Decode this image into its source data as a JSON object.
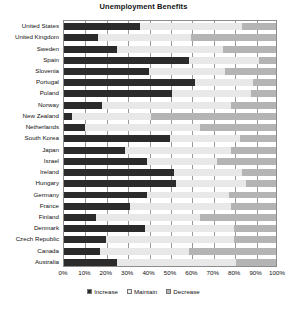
{
  "chart_data": {
    "type": "bar",
    "orientation": "horizontal",
    "stacked": true,
    "normalized_percent": true,
    "title": "Unemployment Benefits",
    "xlabel": "",
    "ylabel": "",
    "xlim": [
      0,
      100
    ],
    "xticks": [
      "0%",
      "10%",
      "20%",
      "30%",
      "40%",
      "50%",
      "60%",
      "70%",
      "80%",
      "90%",
      "100%"
    ],
    "xtick_values": [
      0,
      10,
      20,
      30,
      40,
      50,
      60,
      70,
      80,
      90,
      100
    ],
    "grid": true,
    "legend_position": "bottom",
    "legend": [
      "Increase",
      "Maintain",
      "Decrease"
    ],
    "categories": [
      "United States",
      "United Kingdom",
      "Sweden",
      "Spain",
      "Slovenia",
      "Portugal",
      "Poland",
      "Norway",
      "New Zealand",
      "Netherlands",
      "South Korea",
      "Japan",
      "Israel",
      "Ireland",
      "Hungary",
      "Germany",
      "France",
      "Finland",
      "Denmark",
      "Czech Republic",
      "Canada",
      "Australia"
    ],
    "series": [
      {
        "name": "Increase",
        "color": "#2b2b2b",
        "values": [
          36,
          16,
          25,
          59,
          40,
          62,
          51,
          18,
          4,
          10,
          50,
          29,
          39,
          52,
          53,
          39,
          31,
          15,
          38,
          20,
          17,
          25
        ]
      },
      {
        "name": "Maintain",
        "color": "#e8e8e8",
        "values": [
          48,
          44,
          50,
          33,
          36,
          27,
          37,
          61,
          37,
          54,
          33,
          50,
          33,
          32,
          33,
          39,
          48,
          49,
          42,
          60,
          42,
          56
        ]
      },
      {
        "name": "Decrease",
        "color": "#b4b4b4",
        "values": [
          16,
          40,
          25,
          8,
          24,
          11,
          12,
          21,
          59,
          36,
          17,
          21,
          28,
          16,
          14,
          22,
          21,
          36,
          20,
          20,
          41,
          19
        ]
      }
    ]
  },
  "colors": {
    "increase": "#2b2b2b",
    "maintain": "#e8e8e8",
    "decrease": "#b4b4b4",
    "axis": "#8c8c8c",
    "grid": "#9a9a9a",
    "background": "#ffffff"
  }
}
